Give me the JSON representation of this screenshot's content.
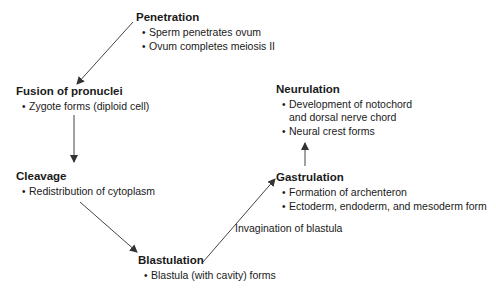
{
  "diagram": {
    "stages": [
      {
        "id": "penetration",
        "title": "Penetration",
        "bullets": [
          "Sperm penetrates ovum",
          "Ovum completes meiosis II"
        ]
      },
      {
        "id": "fusion",
        "title": "Fusion of pronuclei",
        "bullets": [
          "Zygote forms (diploid cell)"
        ]
      },
      {
        "id": "cleavage",
        "title": "Cleavage",
        "bullets": [
          "Redistribution of cytoplasm"
        ]
      },
      {
        "id": "blastulation",
        "title": "Blastulation",
        "bullets": [
          "Blastula (with cavity) forms"
        ]
      },
      {
        "id": "gastrulation",
        "title": "Gastrulation",
        "bullets": [
          "Formation of archenteron",
          "Ectoderm, endoderm, and mesoderm form"
        ]
      },
      {
        "id": "neurulation",
        "title": "Neurulation",
        "bullets": [
          "Development of notochord",
          "and dorsal nerve chord",
          "Neural crest forms"
        ]
      }
    ],
    "edge_labels": {
      "blastulation_to_gastrulation": "Invagination of blastula"
    },
    "colors": {
      "text": "#1a1a1a",
      "arrow": "#333333",
      "background": "#ffffff"
    }
  }
}
